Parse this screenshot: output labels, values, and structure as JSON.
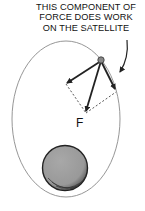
{
  "diagram": {
    "caption_lines": [
      "THIS COMPONENT OF",
      "FORCE DOES WORK",
      "ON THE SATELLITE"
    ],
    "force_label": "F",
    "elements": {
      "orbit": "elliptical orbit",
      "planet": "planet (shaded sphere)",
      "satellite": "satellite (small dot)",
      "force_vector": "gravitational force F toward planet",
      "components": [
        "component perpendicular to velocity",
        "component along the orbit (does work)"
      ]
    },
    "colors": {
      "ink": "#222222",
      "orbit": "#888888",
      "planet_fill": "#9a9a9a",
      "satellite_fill": "#888888"
    }
  }
}
